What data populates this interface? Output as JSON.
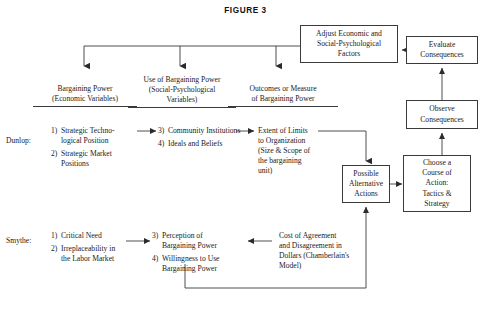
{
  "figure": {
    "title": "FIGURE 3"
  },
  "columns": [
    {
      "id": "col-bargaining-power",
      "line1": "Bargaining Power",
      "line2": "(Economic Variables)"
    },
    {
      "id": "col-use-of-bargaining-power",
      "line1": "Use of Bargaining Power",
      "line2": "(Social-Psychological",
      "line3": "Variables)"
    },
    {
      "id": "col-outcomes",
      "line1": "Outcomes or Measure",
      "line2": "of Bargaining Power"
    }
  ],
  "rows": [
    {
      "id": "row-dunlop",
      "label": "Dunlop:"
    },
    {
      "id": "row-smythe",
      "label": "Smythe:"
    }
  ],
  "dunlop": {
    "economic_items": [
      {
        "num": "1)",
        "text": "Strategic Techno-\nlogical Position"
      },
      {
        "num": "2)",
        "text": "Strategic Market\nPositions"
      }
    ],
    "social_items": [
      {
        "num": "3)",
        "text": "Community Institutions"
      },
      {
        "num": "4)",
        "text": "Ideals and Beliefs"
      }
    ],
    "outcome_text": "Extent of Limits\nto Organization\n(Size & Scope of\nthe bargaining\nunit)"
  },
  "smythe": {
    "economic_items": [
      {
        "num": "1)",
        "text": "Critical Need"
      },
      {
        "num": "2)",
        "text": "Irreplaceability in\nthe Labor Market"
      }
    ],
    "social_items": [
      {
        "num": "3)",
        "text": "Perception of\nBargaining Power"
      },
      {
        "num": "4)",
        "text": "Willingness to Use\nBargaining Power"
      }
    ],
    "outcome_text": "Cost of Agreement\nand Disagreement in\nDollars (Chamberlain's\nModel)"
  },
  "boxes": {
    "adjust_factors": "Adjust Economic and\nSocial-Psychological\nFactors",
    "evaluate_consequences": "Evaluate\nConsequences",
    "observe_consequences": "Observe\nConsequences",
    "choose_course": "Choose a\nCourse of\nAction:\nTactics &\nStrategy",
    "possible_alternative_actions": "Possible\nAlternative\nActions"
  },
  "style": {
    "stroke": "#3a3a3a",
    "text": "#1a1a1a",
    "background": "#ffffff"
  }
}
